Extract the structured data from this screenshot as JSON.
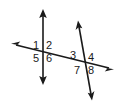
{
  "figure": {
    "background_color": "#ffffff",
    "stroke_color": "#1a1a1a",
    "label_color": "#1a1a1a",
    "width": 128,
    "height": 106
  },
  "lines": [
    {
      "name": "vertical-line",
      "description": "Vertical double-headed arrow line through the left intersection",
      "x1": 43,
      "y1": 10,
      "x2": 43,
      "y2": 84,
      "arrow_start": true,
      "arrow_end": true
    },
    {
      "name": "transversal-line",
      "description": "Nearly horizontal double-headed arrow line crossing both vertical and slanted lines",
      "x1": 12,
      "y1": 44,
      "x2": 113,
      "y2": 69,
      "arrow_start": true,
      "arrow_end": true
    },
    {
      "name": "slanted-line",
      "description": "Steep slanted double-headed arrow line through the right intersection",
      "x1": 78,
      "y1": 21,
      "x2": 92,
      "y2": 100,
      "arrow_start": true,
      "arrow_end": true
    }
  ],
  "intersections": [
    {
      "name": "left-intersection",
      "x": 43,
      "y": 52
    },
    {
      "name": "right-intersection",
      "x": 84,
      "y": 63
    }
  ],
  "angle_labels": [
    {
      "id": "angle-1",
      "text": "1",
      "x": 36,
      "y": 46,
      "intersection": "left-intersection",
      "position": "upper-left"
    },
    {
      "id": "angle-2",
      "text": "2",
      "x": 49,
      "y": 46,
      "intersection": "left-intersection",
      "position": "upper-right"
    },
    {
      "id": "angle-3",
      "text": "3",
      "x": 73,
      "y": 56,
      "intersection": "right-intersection",
      "position": "upper-left"
    },
    {
      "id": "angle-4",
      "text": "4",
      "x": 91,
      "y": 58,
      "intersection": "right-intersection",
      "position": "upper-right"
    },
    {
      "id": "angle-5",
      "text": "5",
      "x": 36,
      "y": 59,
      "intersection": "left-intersection",
      "position": "lower-left"
    },
    {
      "id": "angle-6",
      "text": "6",
      "x": 49,
      "y": 59,
      "intersection": "left-intersection",
      "position": "lower-right"
    },
    {
      "id": "angle-7",
      "text": "7",
      "x": 77,
      "y": 71,
      "intersection": "right-intersection",
      "position": "lower-left"
    },
    {
      "id": "angle-8",
      "text": "8",
      "x": 91,
      "y": 71,
      "intersection": "right-intersection",
      "position": "lower-right"
    }
  ]
}
